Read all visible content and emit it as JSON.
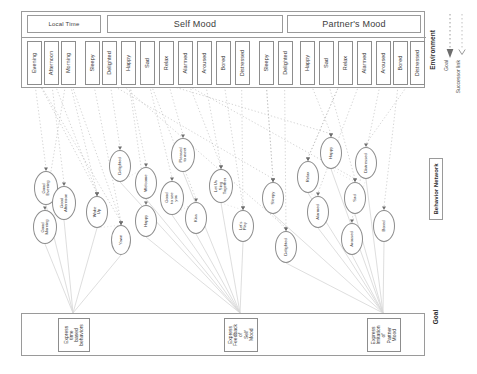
{
  "diagram": {
    "layers": {
      "environment": "Environment",
      "behavior_network": "Behavior Network",
      "goal": "Goal"
    }
  },
  "legend": {
    "items": [
      {
        "name": "goal-link",
        "label": "Goal",
        "style": "dotted-arrow"
      },
      {
        "name": "successor-link",
        "label": "Successor link",
        "style": "dotted-line"
      }
    ]
  },
  "environment": {
    "groups": [
      {
        "name": "local-time",
        "label": "Local Time"
      },
      {
        "name": "self-mood",
        "label": "Self Mood"
      },
      {
        "name": "partner-mood",
        "label": "Partner's Mood"
      }
    ],
    "sensors": [
      {
        "label": "Evening",
        "group": "local-time",
        "x": 26,
        "w": 15
      },
      {
        "label": "Afternoon",
        "group": "local-time",
        "x": 43,
        "w": 15
      },
      {
        "label": "Morning",
        "group": "local-time",
        "x": 60,
        "w": 15
      },
      {
        "label": "Sleepy",
        "group": "self-mood",
        "x": 84,
        "w": 15
      },
      {
        "label": "Delighted",
        "group": "self-mood",
        "x": 101,
        "w": 15
      },
      {
        "label": "Happy",
        "group": "self-mood",
        "x": 120,
        "w": 15
      },
      {
        "label": "Sad",
        "group": "self-mood",
        "x": 139,
        "w": 15
      },
      {
        "label": "Relax",
        "group": "self-mood",
        "x": 158,
        "w": 15
      },
      {
        "label": "Alarmed",
        "group": "self-mood",
        "x": 177,
        "w": 15
      },
      {
        "label": "Aroused",
        "group": "self-mood",
        "x": 196,
        "w": 15
      },
      {
        "label": "Bored",
        "group": "self-mood",
        "x": 215,
        "w": 15
      },
      {
        "label": "Distressed",
        "group": "self-mood",
        "x": 234,
        "w": 15
      },
      {
        "label": "Sleepy",
        "group": "partner-mood",
        "x": 258,
        "w": 15
      },
      {
        "label": "Delighted",
        "group": "partner-mood",
        "x": 277,
        "w": 15
      },
      {
        "label": "Happy",
        "group": "partner-mood",
        "x": 299,
        "w": 15
      },
      {
        "label": "Sad",
        "group": "partner-mood",
        "x": 318,
        "w": 15
      },
      {
        "label": "Relax",
        "group": "partner-mood",
        "x": 337,
        "w": 15
      },
      {
        "label": "Alarmed",
        "group": "partner-mood",
        "x": 356,
        "w": 15
      },
      {
        "label": "Aroused",
        "group": "partner-mood",
        "x": 375,
        "w": 15
      },
      {
        "label": "Bored",
        "group": "partner-mood",
        "x": 392,
        "w": 15
      },
      {
        "label": "Distressed",
        "group": "partner-mood",
        "x": 409,
        "w": 15
      }
    ]
  },
  "behavior_network": {
    "nodes": [
      {
        "label": "Good\nEvening",
        "cx": 46,
        "cy": 188,
        "rx": 12,
        "ry": 17
      },
      {
        "label": "Good\nAfternoon",
        "cx": 64,
        "cy": 203,
        "rx": 12,
        "ry": 17
      },
      {
        "label": "Good\nMorning",
        "cx": 45,
        "cy": 227,
        "rx": 12,
        "ry": 17
      },
      {
        "label": "Wake\nUp",
        "cx": 97,
        "cy": 212,
        "rx": 11,
        "ry": 16
      },
      {
        "label": "Yawn",
        "cx": 121,
        "cy": 240,
        "rx": 10,
        "ry": 15
      },
      {
        "label": "Delighted",
        "cx": 120,
        "cy": 166,
        "rx": 11,
        "ry": 16
      },
      {
        "label": "Welcome",
        "cx": 146,
        "cy": 183,
        "rx": 11,
        "ry": 16
      },
      {
        "label": "Happy",
        "cx": 146,
        "cy": 221,
        "rx": 11,
        "ry": 16
      },
      {
        "label": "Good\nto see\nyou",
        "cx": 172,
        "cy": 198,
        "rx": 12,
        "ry": 17
      },
      {
        "label": "Pleased\nto meet",
        "cx": 183,
        "cy": 155,
        "rx": 12,
        "ry": 17
      },
      {
        "label": "Kiss",
        "cx": 196,
        "cy": 218,
        "rx": 11,
        "ry": 16
      },
      {
        "label": "Let Us\nSing\nTogether",
        "cx": 221,
        "cy": 186,
        "rx": 12,
        "ry": 17
      },
      {
        "label": "Let's\nPlay",
        "cx": 243,
        "cy": 226,
        "rx": 11,
        "ry": 16
      },
      {
        "label": "Sleepy",
        "cx": 273,
        "cy": 198,
        "rx": 11,
        "ry": 16
      },
      {
        "label": "Delighted",
        "cx": 286,
        "cy": 247,
        "rx": 11,
        "ry": 16
      },
      {
        "label": "Relax",
        "cx": 308,
        "cy": 177,
        "rx": 11,
        "ry": 16
      },
      {
        "label": "Alarmed",
        "cx": 318,
        "cy": 212,
        "rx": 11,
        "ry": 16
      },
      {
        "label": "Happy",
        "cx": 331,
        "cy": 153,
        "rx": 11,
        "ry": 16
      },
      {
        "label": "Aroused",
        "cx": 352,
        "cy": 239,
        "rx": 11,
        "ry": 16
      },
      {
        "label": "Sad",
        "cx": 355,
        "cy": 198,
        "rx": 11,
        "ry": 16
      },
      {
        "label": "Distressed",
        "cx": 366,
        "cy": 163,
        "rx": 11,
        "ry": 16
      },
      {
        "label": "Bored",
        "cx": 384,
        "cy": 226,
        "rx": 11,
        "ry": 16
      }
    ]
  },
  "goals": [
    {
      "label": "Express\ntime\nbased\nbehaviors",
      "x": 57,
      "w": 32
    },
    {
      "label": "Express\nFeedback\nof\nSelf\nMood",
      "x": 223,
      "w": 34
    },
    {
      "label": "Express\nImitation\nof\nPartner\nMood",
      "x": 366,
      "w": 34
    }
  ],
  "colors": {
    "border": "#8d8d8d",
    "panel_border": "#9a9a9a",
    "text": "#3a3a3a",
    "link": "#b0b0b0",
    "goal_link": "#d8d8d8"
  }
}
